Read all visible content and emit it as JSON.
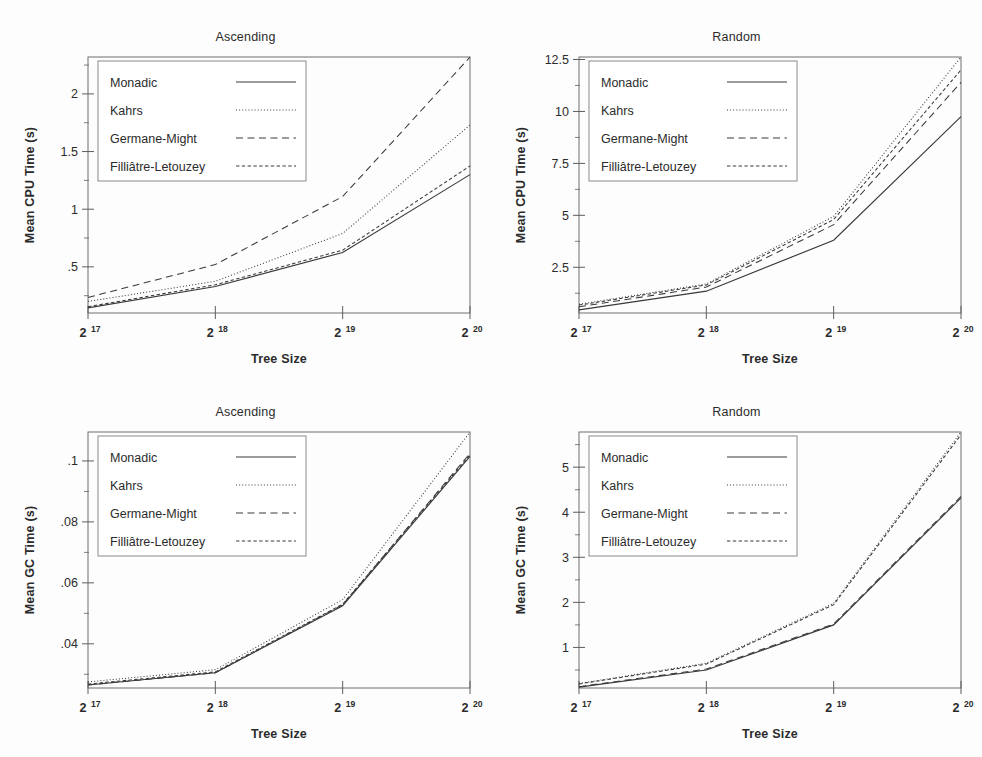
{
  "figure": {
    "background_color": "#fdfdfd",
    "line_color": "#3a3a3a",
    "frame_color": "#6f6f6f"
  },
  "series_names": [
    "Monadic",
    "Kahrs",
    "Germane-Might",
    "Filliâtre-Letouzey"
  ],
  "series_styles": [
    "solid",
    "dotted",
    "dashed",
    "fine-dashed"
  ],
  "xaxis": {
    "title": "Tree Size",
    "tick_bases": [
      "2",
      "2",
      "2",
      "2"
    ],
    "tick_exponents": [
      "17",
      "18",
      "19",
      "20"
    ],
    "tick_labels": [
      "2^17",
      "2^18",
      "2^19",
      "2^20"
    ]
  },
  "panels": [
    {
      "id": "cpu-ascending",
      "title": "Ascending",
      "ylabel": "Mean CPU Time (s)",
      "ytick_labels": [
        "2",
        "1.5",
        "1",
        ".5"
      ],
      "ytick_values": [
        2,
        1.5,
        1,
        0.5
      ],
      "yminor_values": [
        2.25,
        1.75,
        1.25,
        0.75,
        0.25
      ],
      "ylim": [
        0.1,
        2.32
      ],
      "xlim": [
        17,
        20
      ]
    },
    {
      "id": "cpu-random",
      "title": "Random",
      "ylabel": "Mean CPU Time (s)",
      "ytick_labels": [
        "12.5",
        "10",
        "7.5",
        "5",
        "2.5"
      ],
      "ytick_values": [
        12.5,
        10,
        7.5,
        5,
        2.5
      ],
      "yminor_values": [
        11.25,
        8.75,
        6.25,
        3.75,
        1.25
      ],
      "ylim": [
        0.3,
        12.62
      ],
      "xlim": [
        17,
        20
      ]
    },
    {
      "id": "gc-ascending",
      "title": "Ascending",
      "ylabel": "Mean GC Time (s)",
      "ytick_labels": [
        ".1",
        ".08",
        ".06",
        ".04"
      ],
      "ytick_values": [
        0.1,
        0.08,
        0.06,
        0.04
      ],
      "yminor_values": [
        0.11,
        0.09,
        0.07,
        0.05,
        0.03
      ],
      "ylim": [
        0.0255,
        0.1095
      ],
      "xlim": [
        17,
        20
      ]
    },
    {
      "id": "gc-random",
      "title": "Random",
      "ylabel": "Mean GC Time (s)",
      "ytick_labels": [
        "5",
        "4",
        "3",
        "2",
        "1"
      ],
      "ytick_values": [
        5,
        4,
        3,
        2,
        1
      ],
      "yminor_values": [
        5.5,
        4.5,
        3.5,
        2.5,
        1.5,
        0.5
      ],
      "ylim": [
        0.1,
        5.78
      ],
      "xlim": [
        17,
        20
      ]
    }
  ],
  "chart_data": [
    {
      "type": "line",
      "id": "cpu-ascending",
      "title": "Ascending",
      "xlabel": "Tree Size",
      "ylabel": "Mean CPU Time (s)",
      "x": [
        17,
        18,
        19,
        20
      ],
      "x_tick_labels": [
        "2^17",
        "2^18",
        "2^19",
        "2^20"
      ],
      "xlim": [
        17,
        20
      ],
      "ylim": [
        0.1,
        2.32
      ],
      "grid": false,
      "legend_position": "top-left",
      "series": [
        {
          "name": "Monadic",
          "style": "solid",
          "values": [
            0.145,
            0.33,
            0.625,
            1.3
          ]
        },
        {
          "name": "Kahrs",
          "style": "dotted",
          "values": [
            0.2,
            0.375,
            0.79,
            1.73
          ]
        },
        {
          "name": "Germane-Might",
          "style": "dashed",
          "values": [
            0.235,
            0.52,
            1.11,
            2.32
          ]
        },
        {
          "name": "Filliâtre-Letouzey",
          "style": "fine-dashed",
          "values": [
            0.155,
            0.345,
            0.645,
            1.375
          ]
        }
      ]
    },
    {
      "type": "line",
      "id": "cpu-random",
      "title": "Random",
      "xlabel": "Tree Size",
      "ylabel": "Mean CPU Time (s)",
      "x": [
        17,
        18,
        19,
        20
      ],
      "x_tick_labels": [
        "2^17",
        "2^18",
        "2^19",
        "2^20"
      ],
      "xlim": [
        17,
        20
      ],
      "ylim": [
        0.3,
        12.62
      ],
      "grid": false,
      "legend_position": "top-left",
      "series": [
        {
          "name": "Monadic",
          "style": "solid",
          "values": [
            0.45,
            1.35,
            3.8,
            9.75
          ]
        },
        {
          "name": "Kahrs",
          "style": "dotted",
          "values": [
            0.72,
            1.7,
            4.95,
            12.62
          ]
        },
        {
          "name": "Germane-Might",
          "style": "dashed",
          "values": [
            0.6,
            1.55,
            4.55,
            11.4
          ]
        },
        {
          "name": "Filliâtre-Letouzey",
          "style": "fine-dashed",
          "values": [
            0.68,
            1.65,
            4.8,
            12.0
          ]
        }
      ]
    },
    {
      "type": "line",
      "id": "gc-ascending",
      "title": "Ascending",
      "xlabel": "Tree Size",
      "ylabel": "Mean GC Time (s)",
      "x": [
        17,
        18,
        19,
        20
      ],
      "x_tick_labels": [
        "2^17",
        "2^18",
        "2^19",
        "2^20"
      ],
      "xlim": [
        17,
        20
      ],
      "ylim": [
        0.0255,
        0.1095
      ],
      "grid": false,
      "legend_position": "top-left",
      "series": [
        {
          "name": "Monadic",
          "style": "solid",
          "values": [
            0.0265,
            0.0305,
            0.0525,
            0.1015
          ]
        },
        {
          "name": "Kahrs",
          "style": "dotted",
          "values": [
            0.0275,
            0.0315,
            0.0545,
            0.1095
          ]
        },
        {
          "name": "Germane-Might",
          "style": "dashed",
          "values": [
            0.0265,
            0.0305,
            0.0528,
            0.1025
          ]
        },
        {
          "name": "Filliâtre-Letouzey",
          "style": "fine-dashed",
          "values": [
            0.0268,
            0.0308,
            0.053,
            0.102
          ]
        }
      ]
    },
    {
      "type": "line",
      "id": "gc-random",
      "title": "Random",
      "xlabel": "Tree Size",
      "ylabel": "Mean GC Time (s)",
      "x": [
        17,
        18,
        19,
        20
      ],
      "x_tick_labels": [
        "2^17",
        "2^18",
        "2^19",
        "2^20"
      ],
      "xlim": [
        17,
        20
      ],
      "ylim": [
        0.1,
        5.78
      ],
      "grid": false,
      "legend_position": "top-left",
      "series": [
        {
          "name": "Monadic",
          "style": "solid",
          "values": [
            0.12,
            0.5,
            1.5,
            4.32
          ]
        },
        {
          "name": "Kahrs",
          "style": "dotted",
          "values": [
            0.2,
            0.65,
            1.98,
            5.78
          ]
        },
        {
          "name": "Germane-Might",
          "style": "dashed",
          "values": [
            0.13,
            0.52,
            1.52,
            4.35
          ]
        },
        {
          "name": "Filliâtre-Letouzey",
          "style": "fine-dashed",
          "values": [
            0.19,
            0.63,
            1.95,
            5.72
          ]
        }
      ]
    }
  ]
}
